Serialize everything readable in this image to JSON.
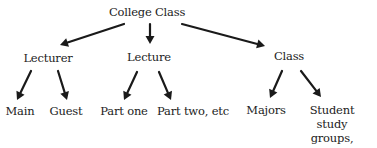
{
  "diagram": {
    "type": "tree",
    "text_color": "#222222",
    "arrow_color": "#1a1a1a",
    "root": {
      "id": "college-class",
      "label": "College Class"
    },
    "nodes": [
      {
        "id": "college-class",
        "label": "College Class"
      },
      {
        "id": "lecturer",
        "label": "Lecturer"
      },
      {
        "id": "lecture",
        "label": "Lecture"
      },
      {
        "id": "class",
        "label": "Class"
      },
      {
        "id": "main",
        "label": "Main"
      },
      {
        "id": "guest",
        "label": "Guest"
      },
      {
        "id": "part-one",
        "label": "Part one"
      },
      {
        "id": "part-two",
        "label": "Part two, etc"
      },
      {
        "id": "majors",
        "label": "Majors"
      },
      {
        "id": "student-study-groups",
        "label": "Student study\ngroups, etc."
      }
    ],
    "edges": [
      {
        "from": "college-class",
        "to": "lecturer"
      },
      {
        "from": "college-class",
        "to": "lecture"
      },
      {
        "from": "college-class",
        "to": "class"
      },
      {
        "from": "lecturer",
        "to": "main"
      },
      {
        "from": "lecturer",
        "to": "guest"
      },
      {
        "from": "lecture",
        "to": "part-one"
      },
      {
        "from": "lecture",
        "to": "part-two"
      },
      {
        "from": "class",
        "to": "majors"
      },
      {
        "from": "class",
        "to": "student-study-groups"
      }
    ]
  }
}
